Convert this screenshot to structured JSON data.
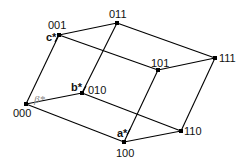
{
  "diagram": {
    "type": "cube-lattice",
    "nodes": [
      {
        "id": "000",
        "label": "000",
        "x": 26,
        "y": 104
      },
      {
        "id": "001",
        "label": "001",
        "x": 59,
        "y": 35
      },
      {
        "id": "010",
        "label": "010",
        "x": 82,
        "y": 93
      },
      {
        "id": "011",
        "label": "011",
        "x": 117,
        "y": 23
      },
      {
        "id": "100",
        "label": "100",
        "x": 124,
        "y": 142
      },
      {
        "id": "101",
        "label": "101",
        "x": 158,
        "y": 70
      },
      {
        "id": "110",
        "label": "110",
        "x": 181,
        "y": 131
      },
      {
        "id": "111",
        "label": "111",
        "x": 215,
        "y": 58
      }
    ],
    "edges": [
      [
        "000",
        "001"
      ],
      [
        "000",
        "010"
      ],
      [
        "000",
        "100"
      ],
      [
        "001",
        "011"
      ],
      [
        "001",
        "101"
      ],
      [
        "010",
        "011"
      ],
      [
        "010",
        "110"
      ],
      [
        "100",
        "101"
      ],
      [
        "100",
        "110"
      ],
      [
        "011",
        "111"
      ],
      [
        "101",
        "111"
      ],
      [
        "110",
        "111"
      ]
    ],
    "annotations": {
      "a_star": "a*",
      "b_star": "b*",
      "c_star": "c*",
      "beta_star": "β*"
    }
  }
}
